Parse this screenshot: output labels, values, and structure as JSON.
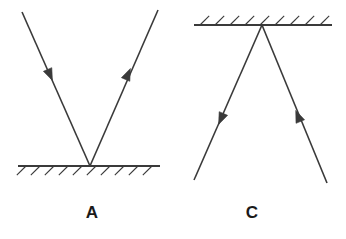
{
  "figure": {
    "kind": "physics-ray-diagram",
    "width": 346,
    "height": 239,
    "background_color": "#ffffff",
    "stroke_color": "#3a3a3a",
    "label_color": "#1a1a1a",
    "panel_count": 2
  },
  "panels": [
    {
      "id": "panel-a",
      "label": "A",
      "label_position": {
        "x": 92,
        "y": 213
      },
      "mirror": {
        "name": "plane-mirror",
        "orientation": "horizontal",
        "position": "bottom",
        "x1": 18,
        "y1": 166,
        "x2": 160,
        "y2": 166,
        "line_width": 2.2,
        "hatching": {
          "side": "below",
          "direction": "down-left",
          "count": 10,
          "length": 13,
          "angle_deg": 45,
          "spacing": 14,
          "start_x": 26,
          "line_width": 1.1
        }
      },
      "vertex": {
        "x": 90,
        "y": 166
      },
      "rays": [
        {
          "name": "incident-ray",
          "role": "incident",
          "from": {
            "x": 22,
            "y": 12
          },
          "to": {
            "x": 90,
            "y": 166
          },
          "arrow": {
            "name": "arrowhead-incident-a",
            "position": {
              "x": 50,
              "y": 75
            },
            "points": "toward-mirror",
            "direction": "down-right"
          }
        },
        {
          "name": "reflected-ray",
          "role": "reflected",
          "from": {
            "x": 90,
            "y": 166
          },
          "to": {
            "x": 158,
            "y": 10
          },
          "arrow": {
            "name": "arrowhead-reflected-a",
            "position": {
              "x": 128,
              "y": 74
            },
            "points": "away-from-mirror",
            "direction": "up-right"
          }
        }
      ]
    },
    {
      "id": "panel-c",
      "label": "C",
      "label_position": {
        "x": 252,
        "y": 213
      },
      "mirror": {
        "name": "plane-mirror",
        "orientation": "horizontal",
        "position": "top",
        "x1": 194,
        "y1": 25,
        "x2": 332,
        "y2": 25,
        "line_width": 2.2,
        "hatching": {
          "side": "above",
          "direction": "up-right",
          "count": 9,
          "length": 13,
          "angle_deg": 45,
          "spacing": 15,
          "start_x": 200,
          "line_width": 1.1
        }
      },
      "vertex": {
        "x": 262,
        "y": 25
      },
      "rays": [
        {
          "name": "reflected-ray",
          "role": "reflected",
          "from": {
            "x": 262,
            "y": 25
          },
          "to": {
            "x": 194,
            "y": 180
          },
          "arrow": {
            "name": "arrowhead-reflected-c",
            "position": {
              "x": 221,
              "y": 119
            },
            "points": "away-from-mirror",
            "direction": "down-left"
          }
        },
        {
          "name": "incident-ray",
          "role": "incident",
          "from": {
            "x": 327,
            "y": 183
          },
          "to": {
            "x": 262,
            "y": 25
          },
          "arrow": {
            "name": "arrowhead-incident-c",
            "position": {
              "x": 298,
              "y": 116
            },
            "points": "toward-mirror",
            "direction": "up-left"
          }
        }
      ]
    }
  ]
}
